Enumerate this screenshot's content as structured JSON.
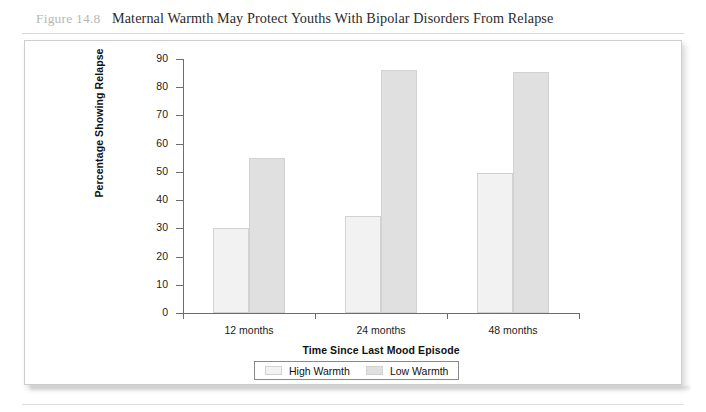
{
  "figure": {
    "number_label": "Figure 14.8",
    "title": "Maternal Warmth May Protect Youths With Bipolar Disorders From Relapse"
  },
  "chart_data": {
    "type": "bar",
    "title": "Maternal Warmth May Protect Youths With Bipolar Disorders From Relapse",
    "xlabel": "Time Since Last Mood Episode",
    "ylabel": "Percentage Showing Relapse",
    "categories": [
      "12 months",
      "24 months",
      "48 months"
    ],
    "series": [
      {
        "name": "High Warmth",
        "values": [
          30,
          34.5,
          49.5
        ],
        "color": "#f2f2f2"
      },
      {
        "name": "Low Warmth",
        "values": [
          55,
          86,
          85.5
        ],
        "color": "#e0e0e0"
      }
    ],
    "ylim": [
      0,
      90
    ],
    "ytick_step": 10,
    "yticks": [
      "0",
      "10",
      "20",
      "30",
      "40",
      "50",
      "60",
      "70",
      "80",
      "90"
    ],
    "grid": false,
    "legend_position": "bottom-center",
    "legend_entries": [
      "High Warmth",
      "Low Warmth"
    ]
  },
  "style": {
    "bar_border_color": "#d2d2d2",
    "axis_color": "#6d6d6d",
    "text_color": "#1c1c1c"
  }
}
